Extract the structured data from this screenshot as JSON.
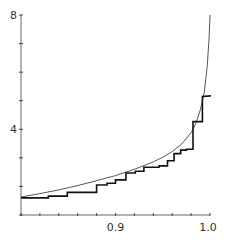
{
  "chart_data": {
    "type": "line",
    "title": "",
    "xlabel": "",
    "ylabel": "",
    "xlim": [
      0.8,
      1.0
    ],
    "ylim": [
      1,
      8
    ],
    "grid": false,
    "legend": null,
    "x_ticks": [
      0.8,
      0.82,
      0.84,
      0.86,
      0.88,
      0.9,
      0.92,
      0.94,
      0.96,
      0.98,
      1.0
    ],
    "x_tick_labels": [
      {
        "value": 0.9,
        "label": "0.9"
      },
      {
        "value": 1.0,
        "label": "1.0"
      }
    ],
    "y_ticks": [
      1,
      2,
      3,
      4,
      5,
      6,
      7,
      8
    ],
    "y_tick_labels": [
      {
        "value": 4,
        "label": "4"
      },
      {
        "value": 8,
        "label": "8"
      }
    ],
    "series": [
      {
        "name": "smooth curve",
        "style": "thin smooth line",
        "x": [
          0.8,
          0.82,
          0.84,
          0.86,
          0.88,
          0.9,
          0.92,
          0.94,
          0.95,
          0.96,
          0.97,
          0.98,
          0.985,
          0.99,
          0.994,
          0.997,
          0.999,
          1.0
        ],
        "y": [
          1.63,
          1.75,
          1.88,
          2.03,
          2.2,
          2.38,
          2.6,
          2.86,
          3.02,
          3.22,
          3.48,
          3.88,
          4.2,
          4.7,
          5.3,
          6.2,
          7.2,
          8.0
        ]
      },
      {
        "name": "step function",
        "style": "thick staircase line",
        "x": [
          0.8,
          0.829,
          0.829,
          0.849,
          0.849,
          0.88,
          0.88,
          0.891,
          0.891,
          0.9,
          0.9,
          0.911,
          0.911,
          0.921,
          0.921,
          0.93,
          0.93,
          0.946,
          0.946,
          0.955,
          0.955,
          0.962,
          0.962,
          0.969,
          0.969,
          0.975,
          0.975,
          0.982,
          0.982,
          0.992,
          0.992,
          1.001
        ],
        "y": [
          1.6,
          1.6,
          1.66,
          1.66,
          1.79,
          1.79,
          2.05,
          2.05,
          2.11,
          2.11,
          2.23,
          2.23,
          2.47,
          2.47,
          2.53,
          2.53,
          2.67,
          2.67,
          2.72,
          2.72,
          2.9,
          2.9,
          3.15,
          3.15,
          3.27,
          3.27,
          3.3,
          3.3,
          4.27,
          4.27,
          5.15,
          5.17
        ]
      }
    ]
  }
}
